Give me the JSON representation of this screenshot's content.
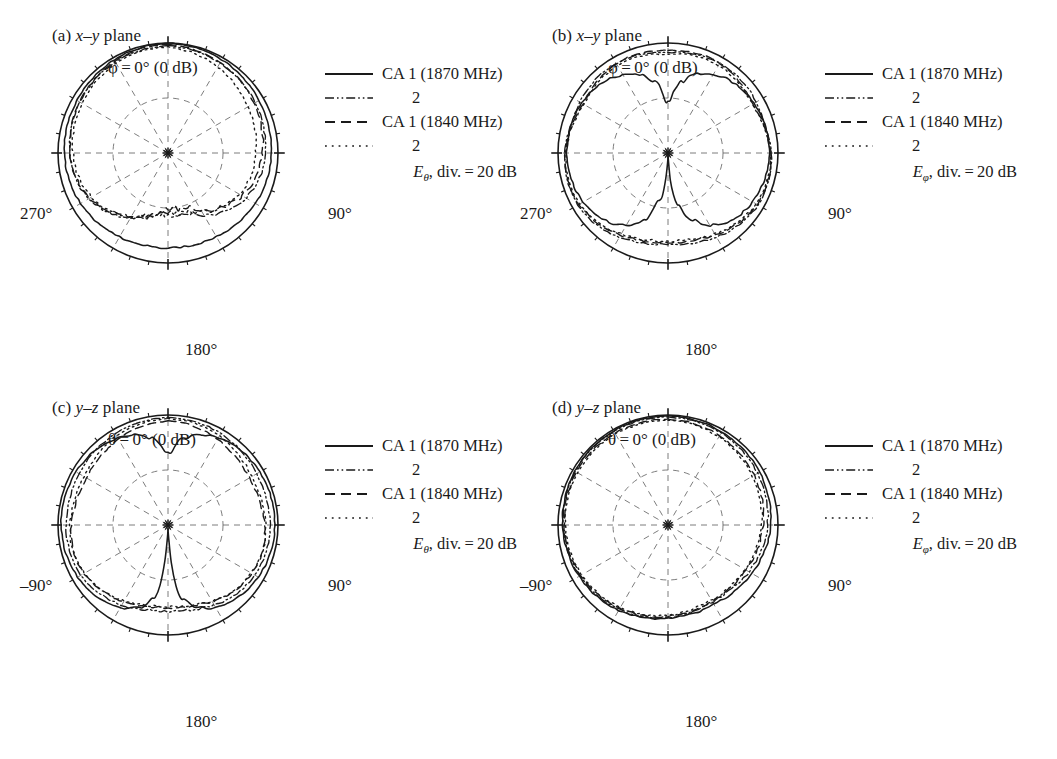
{
  "figure": {
    "type": "polar-radiation-pattern-figure",
    "panel_count": 4,
    "background": "#ffffff",
    "ink": "#1a1a1a"
  },
  "legend_common": {
    "entries": [
      {
        "style": "solid",
        "label": "CA 1 (1870 MHz)",
        "indent": false
      },
      {
        "style": "dash-dot-dot",
        "label": "2",
        "indent": true
      },
      {
        "style": "dashed",
        "label": "CA 1 (1840 MHz)",
        "indent": false
      },
      {
        "style": "dotted",
        "label": "2",
        "indent": true
      }
    ]
  },
  "panels": [
    {
      "id": "a",
      "caption_prefix": "(a)",
      "caption_plane": "x–y",
      "caption_suffix": "plane",
      "top_label_symbol": "φ",
      "top_label": "φ = 0° (0 dB)",
      "left_label": "270°",
      "right_label": "90°",
      "bottom_label": "180°",
      "field_symbol": "E",
      "field_sub": "θ",
      "scale_note": ", div. = 20 dB"
    },
    {
      "id": "b",
      "caption_prefix": "(b)",
      "caption_plane": "x–y",
      "caption_suffix": "plane",
      "top_label_symbol": "φ",
      "top_label": "φ = 0° (0 dB)",
      "left_label": "270°",
      "right_label": "90°",
      "bottom_label": "180°",
      "field_symbol": "E",
      "field_sub": "φ",
      "scale_note": ", div. = 20 dB"
    },
    {
      "id": "c",
      "caption_prefix": "(c)",
      "caption_plane": "y–z",
      "caption_suffix": "plane",
      "top_label_symbol": "θ",
      "top_label": "θ = 0° (0 dB)",
      "left_label": "–90°",
      "right_label": "90°",
      "bottom_label": "180°",
      "field_symbol": "E",
      "field_sub": "θ",
      "scale_note": ", div. = 20 dB"
    },
    {
      "id": "d",
      "caption_prefix": "(d)",
      "caption_plane": "y–z",
      "caption_suffix": "plane",
      "top_label_symbol": "θ",
      "top_label": "θ = 0° (0 dB)",
      "left_label": "–90°",
      "right_label": "90°",
      "bottom_label": "180°",
      "field_symbol": "E",
      "field_sub": "φ",
      "scale_note": ", div. = 20 dB"
    }
  ],
  "chart_data": {
    "type": "line",
    "plot_kind": "polar",
    "grid": true,
    "legend_position": "upper-right",
    "angle_unit": "degrees",
    "angle_start_top": 0,
    "angle_direction": "clockwise",
    "radial_unit": "dB",
    "radial_max_db": 0,
    "radial_div_db": 20,
    "radial_rings_db": [
      -20,
      -40
    ],
    "spoke_interval_deg": 30,
    "tick_interval_deg": 10,
    "center_marker": "asterisk",
    "series_names": [
      "CA 1 (1870 MHz)",
      "CA 2 (1870 MHz)",
      "CA 1 (1840 MHz)",
      "CA 2 (1840 MHz)"
    ],
    "series_styles": [
      "solid",
      "dash-dot-dot",
      "dashed",
      "dotted"
    ],
    "angles_deg": [
      0,
      10,
      20,
      30,
      40,
      50,
      60,
      70,
      80,
      90,
      100,
      110,
      120,
      130,
      140,
      150,
      160,
      170,
      180,
      190,
      200,
      210,
      220,
      230,
      240,
      250,
      260,
      270,
      280,
      290,
      300,
      310,
      320,
      330,
      340,
      350
    ],
    "panels": [
      {
        "id": "a",
        "plane": "x-y",
        "component": "E_theta",
        "series": [
          {
            "name": "CA 1 (1870 MHz)",
            "style": "solid",
            "values_db": [
              0,
              -0.3,
              -0.6,
              -0.9,
              -1.2,
              -1.5,
              -1.8,
              -2.0,
              -2.2,
              -2.4,
              -2.6,
              -2.9,
              -3.3,
              -3.8,
              -4.3,
              -4.8,
              -5.2,
              -5.4,
              -5.5,
              -5.4,
              -5.2,
              -4.8,
              -4.3,
              -3.8,
              -3.3,
              -2.9,
              -2.6,
              -2.4,
              -2.2,
              -2.0,
              -1.8,
              -1.5,
              -1.2,
              -0.9,
              -0.6,
              -0.3
            ]
          },
          {
            "name": "CA 2 (1870 MHz)",
            "style": "dash-dot-dot",
            "values_db": [
              -1.0,
              -1.4,
              -1.8,
              -2.2,
              -2.6,
              -3.0,
              -3.4,
              -3.8,
              -4.2,
              -4.6,
              -5.2,
              -6.0,
              -7.2,
              -9.0,
              -11.5,
              -14.0,
              -16.5,
              -18.0,
              -18.5,
              -17.5,
              -15.5,
              -13.0,
              -10.5,
              -8.4,
              -6.8,
              -5.6,
              -4.8,
              -4.2,
              -3.8,
              -3.4,
              -3.0,
              -2.6,
              -2.2,
              -1.8,
              -1.5,
              -1.2
            ]
          },
          {
            "name": "CA 1 (1840 MHz)",
            "style": "dashed",
            "values_db": [
              -0.6,
              -1.0,
              -1.5,
              -2.0,
              -2.6,
              -3.2,
              -3.8,
              -4.4,
              -5.0,
              -5.6,
              -6.4,
              -7.4,
              -8.8,
              -10.8,
              -13.5,
              -16.0,
              -18.5,
              -19.8,
              -19.5,
              -18.0,
              -16.0,
              -13.5,
              -11.0,
              -8.8,
              -7.0,
              -5.8,
              -5.0,
              -4.4,
              -3.9,
              -3.4,
              -2.9,
              -2.4,
              -1.9,
              -1.4,
              -1.0,
              -0.7
            ]
          },
          {
            "name": "CA 2 (1840 MHz)",
            "style": "dotted",
            "values_db": [
              -1.5,
              -2.2,
              -3.0,
              -3.9,
              -4.8,
              -5.6,
              -6.4,
              -7.0,
              -7.6,
              -8.0,
              -8.4,
              -9.0,
              -10.0,
              -11.5,
              -13.5,
              -15.5,
              -17.0,
              -17.8,
              -17.5,
              -16.5,
              -15.0,
              -13.0,
              -11.0,
              -9.2,
              -7.8,
              -6.8,
              -6.0,
              -5.4,
              -4.9,
              -4.4,
              -3.9,
              -3.4,
              -2.9,
              -2.4,
              -2.0,
              -1.7
            ]
          }
        ]
      },
      {
        "id": "b",
        "plane": "x-y",
        "component": "E_phi",
        "series": [
          {
            "name": "CA 1 (1870 MHz)",
            "style": "solid",
            "values_db": [
              -22,
              -14,
              -9.5,
              -7.0,
              -5.4,
              -4.4,
              -3.8,
              -3.4,
              -3.2,
              -3.2,
              -3.4,
              -3.8,
              -4.4,
              -5.4,
              -7.0,
              -9.5,
              -14,
              -22,
              -40,
              -22,
              -14,
              -9.5,
              -7.0,
              -5.4,
              -4.4,
              -3.8,
              -3.4,
              -3.2,
              -3.2,
              -3.4,
              -3.8,
              -4.4,
              -5.4,
              -7.0,
              -9.5,
              -14
            ]
          },
          {
            "name": "CA 2 (1870 MHz)",
            "style": "dash-dot-dot",
            "values_db": [
              -3.5,
              -3.0,
              -2.6,
              -2.4,
              -2.4,
              -2.6,
              -3.0,
              -3.4,
              -3.0,
              -2.5,
              -2.2,
              -2.0,
              -2.2,
              -2.8,
              -3.6,
              -4.6,
              -5.6,
              -6.4,
              -6.8,
              -6.4,
              -5.6,
              -4.6,
              -3.6,
              -2.8,
              -2.2,
              -2.0,
              -2.2,
              -2.5,
              -3.0,
              -3.4,
              -3.0,
              -2.6,
              -2.4,
              -2.4,
              -2.6,
              -3.0
            ]
          },
          {
            "name": "CA 1 (1840 MHz)",
            "style": "dashed",
            "values_db": [
              -2.8,
              -2.4,
              -2.2,
              -2.4,
              -3.0,
              -3.8,
              -4.4,
              -4.0,
              -3.2,
              -2.6,
              -2.2,
              -2.2,
              -2.6,
              -3.4,
              -4.4,
              -5.6,
              -6.6,
              -7.2,
              -7.4,
              -7.2,
              -6.6,
              -5.6,
              -4.4,
              -3.4,
              -2.6,
              -2.2,
              -2.2,
              -2.6,
              -3.2,
              -4.0,
              -4.4,
              -3.8,
              -3.0,
              -2.4,
              -2.2,
              -2.4
            ]
          },
          {
            "name": "CA 2 (1840 MHz)",
            "style": "dotted",
            "values_db": [
              -4.2,
              -3.6,
              -3.2,
              -3.2,
              -3.6,
              -4.2,
              -4.6,
              -4.2,
              -3.4,
              -2.8,
              -2.5,
              -2.6,
              -3.0,
              -3.8,
              -4.8,
              -6.0,
              -7.0,
              -7.8,
              -8.0,
              -7.8,
              -7.0,
              -6.0,
              -4.8,
              -3.8,
              -3.0,
              -2.6,
              -2.5,
              -2.8,
              -3.4,
              -4.2,
              -4.6,
              -4.2,
              -3.6,
              -3.2,
              -3.2,
              -3.6
            ]
          }
        ]
      },
      {
        "id": "c",
        "plane": "y-z",
        "component": "E_theta",
        "series": [
          {
            "name": "CA 1 (1870 MHz)",
            "style": "solid",
            "values_db": [
              -14,
              -8.0,
              -5.0,
              -3.4,
              -2.4,
              -1.8,
              -1.4,
              -1.2,
              -1.1,
              -1.1,
              -1.3,
              -1.6,
              -2.1,
              -2.8,
              -3.8,
              -5.4,
              -8.0,
              -13,
              -40,
              -13,
              -8.0,
              -5.4,
              -3.8,
              -2.8,
              -2.1,
              -1.6,
              -1.3,
              -1.1,
              -1.1,
              -1.2,
              -1.4,
              -1.8,
              -2.4,
              -3.4,
              -5.0,
              -8.0
            ]
          },
          {
            "name": "CA 2 (1870 MHz)",
            "style": "dash-dot-dot",
            "values_db": [
              -1.0,
              -1.1,
              -1.3,
              -1.6,
              -2.0,
              -2.4,
              -2.8,
              -3.0,
              -3.0,
              -2.9,
              -2.9,
              -3.1,
              -3.5,
              -4.2,
              -5.2,
              -6.4,
              -7.6,
              -8.4,
              -8.6,
              -8.4,
              -7.6,
              -6.4,
              -5.2,
              -4.2,
              -3.5,
              -3.1,
              -2.9,
              -2.9,
              -3.0,
              -3.0,
              -2.8,
              -2.4,
              -2.0,
              -1.6,
              -1.3,
              -1.1
            ]
          },
          {
            "name": "CA 1 (1840 MHz)",
            "style": "dashed",
            "values_db": [
              -2.2,
              -2.6,
              -3.2,
              -4.0,
              -4.8,
              -5.4,
              -5.8,
              -5.8,
              -5.4,
              -4.8,
              -4.4,
              -4.4,
              -4.8,
              -5.6,
              -6.6,
              -7.8,
              -9.0,
              -9.8,
              -10.0,
              -9.8,
              -9.0,
              -7.8,
              -6.6,
              -5.6,
              -4.8,
              -4.4,
              -4.4,
              -4.8,
              -5.4,
              -5.8,
              -5.8,
              -5.4,
              -4.8,
              -4.0,
              -3.2,
              -2.6
            ]
          },
          {
            "name": "CA 2 (1840 MHz)",
            "style": "dotted",
            "values_db": [
              -1.4,
              -1.6,
              -2.0,
              -2.6,
              -3.4,
              -4.2,
              -4.8,
              -5.0,
              -4.8,
              -4.4,
              -4.2,
              -4.4,
              -5.0,
              -5.8,
              -6.8,
              -8.0,
              -9.2,
              -10.0,
              -10.2,
              -10.0,
              -9.2,
              -8.0,
              -6.8,
              -5.8,
              -5.0,
              -4.4,
              -4.2,
              -4.4,
              -4.8,
              -5.0,
              -4.8,
              -4.2,
              -3.4,
              -2.6,
              -2.0,
              -1.6
            ]
          }
        ]
      },
      {
        "id": "d",
        "plane": "y-z",
        "component": "E_phi",
        "series": [
          {
            "name": "CA 1 (1870 MHz)",
            "style": "solid",
            "values_db": [
              -0.4,
              -0.5,
              -0.7,
              -0.9,
              -1.1,
              -1.3,
              -1.6,
              -1.9,
              -2.2,
              -2.6,
              -3.2,
              -4.0,
              -4.8,
              -5.6,
              -6.2,
              -6.6,
              -6.6,
              -6.4,
              -6.0,
              -5.4,
              -4.8,
              -4.2,
              -3.6,
              -3.1,
              -2.7,
              -2.3,
              -2.0,
              -1.7,
              -1.4,
              -1.1,
              -0.9,
              -0.7,
              -0.6,
              -0.5,
              -0.4,
              -0.4
            ]
          },
          {
            "name": "CA 2 (1870 MHz)",
            "style": "dash-dot-dot",
            "values_db": [
              -0.8,
              -0.9,
              -1.1,
              -1.4,
              -1.7,
              -2.0,
              -2.4,
              -2.8,
              -3.3,
              -3.8,
              -4.4,
              -5.2,
              -6.0,
              -6.8,
              -7.4,
              -7.6,
              -7.4,
              -7.0,
              -6.4,
              -5.8,
              -5.2,
              -4.6,
              -4.0,
              -3.5,
              -3.0,
              -2.6,
              -2.2,
              -1.9,
              -1.6,
              -1.3,
              -1.1,
              -0.9,
              -0.8,
              -0.7,
              -0.7,
              -0.7
            ]
          },
          {
            "name": "CA 1 (1840 MHz)",
            "style": "dashed",
            "values_db": [
              -1.6,
              -1.8,
              -2.1,
              -2.5,
              -2.9,
              -3.3,
              -3.8,
              -4.3,
              -4.8,
              -5.4,
              -6.0,
              -6.6,
              -7.2,
              -7.6,
              -7.8,
              -7.8,
              -7.6,
              -7.2,
              -6.8,
              -6.2,
              -5.6,
              -5.0,
              -4.4,
              -3.9,
              -3.4,
              -3.0,
              -2.6,
              -2.3,
              -2.0,
              -1.8,
              -1.6,
              -1.5,
              -1.4,
              -1.4,
              -1.5,
              -1.5
            ]
          },
          {
            "name": "CA 2 (1840 MHz)",
            "style": "dotted",
            "values_db": [
              -2.0,
              -2.2,
              -2.6,
              -3.0,
              -3.5,
              -4.0,
              -4.5,
              -5.0,
              -5.5,
              -6.0,
              -6.6,
              -7.2,
              -7.8,
              -8.2,
              -8.4,
              -8.4,
              -8.2,
              -7.8,
              -7.2,
              -6.6,
              -6.0,
              -5.4,
              -4.8,
              -4.3,
              -3.8,
              -3.4,
              -3.0,
              -2.7,
              -2.4,
              -2.2,
              -2.0,
              -1.9,
              -1.8,
              -1.8,
              -1.9,
              -1.9
            ]
          }
        ]
      }
    ]
  }
}
